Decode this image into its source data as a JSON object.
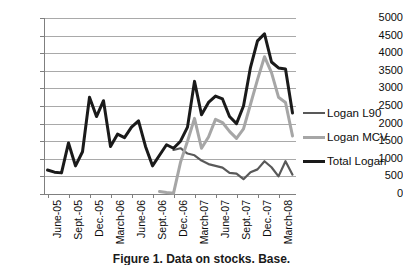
{
  "chart_data": {
    "type": "line",
    "title": "",
    "xlabel": "",
    "ylabel": "",
    "ylim": [
      0,
      5000
    ],
    "ytick_step": 500,
    "yticks": [
      5000,
      4500,
      4000,
      3500,
      3000,
      2500,
      2000,
      1500,
      1000,
      500,
      0
    ],
    "grid": true,
    "legend_position": "right",
    "x": [
      "June-05",
      "July-05",
      "Aug.-05",
      "Sept.-05",
      "Oct.-05",
      "Nov.-05",
      "Dec.-05",
      "Jan.-06",
      "Feb.-06",
      "March-06",
      "April-06",
      "May-06",
      "June-06",
      "July-06",
      "Aug.-06",
      "Sept.-06",
      "Oct.-06",
      "Nov.-06",
      "Dec.-06",
      "Jan.-07",
      "Feb.-07",
      "March-07",
      "April-07",
      "May-07",
      "June-07",
      "July-07",
      "Aug.-07",
      "Sept.-07",
      "Oct.-07",
      "Nov.-07",
      "Dec.-07",
      "Jan.-08",
      "Feb.-08",
      "March-08",
      "April-08",
      "May-08"
    ],
    "xtick_labels": [
      "June-05",
      "Sept.-05",
      "Dec.-05",
      "March-06",
      "June-06",
      "Sept.-06",
      "Dec.-06",
      "March-07",
      "June-07",
      "Sept.-07",
      "Dec.-07",
      "March-08"
    ],
    "xtick_indices": [
      0,
      3,
      6,
      9,
      12,
      15,
      18,
      21,
      24,
      27,
      30,
      33
    ],
    "series": [
      {
        "name": "Logan L90",
        "color": "#595959",
        "values": [
          null,
          null,
          null,
          null,
          null,
          null,
          null,
          null,
          null,
          null,
          null,
          null,
          null,
          null,
          null,
          null,
          null,
          null,
          1250,
          1300,
          1150,
          1100,
          950,
          850,
          800,
          750,
          600,
          580,
          420,
          620,
          700,
          930,
          760,
          500,
          930,
          550
        ]
      },
      {
        "name": "Logan MCV",
        "color": "#a6a6a6",
        "values": [
          null,
          null,
          null,
          null,
          null,
          null,
          null,
          null,
          null,
          null,
          null,
          null,
          null,
          null,
          null,
          null,
          70,
          40,
          20,
          900,
          1500,
          2150,
          1300,
          1620,
          2120,
          2030,
          1780,
          1580,
          1850,
          2550,
          3250,
          3900,
          3450,
          2750,
          2600,
          1650
        ]
      },
      {
        "name": "Total Logan",
        "color": "#1a1a1a",
        "values": [
          680,
          620,
          600,
          1450,
          800,
          1200,
          2750,
          2200,
          2650,
          1350,
          1700,
          1600,
          1900,
          2080,
          1350,
          800,
          1100,
          1400,
          1300,
          1500,
          1900,
          3200,
          2250,
          2600,
          2780,
          2700,
          2200,
          2000,
          2500,
          3600,
          4350,
          4550,
          3750,
          3580,
          3550,
          2300
        ]
      }
    ]
  },
  "legend": {
    "items": [
      {
        "label": "Logan L90",
        "color": "#595959",
        "thickness": 2
      },
      {
        "label": "Logan MCV",
        "color": "#a6a6a6",
        "thickness": 3
      },
      {
        "label": "Total Logan",
        "color": "#1a1a1a",
        "thickness": 3
      }
    ]
  },
  "caption": {
    "text": "Figure 1. Data on stocks. Base."
  }
}
